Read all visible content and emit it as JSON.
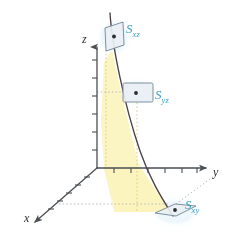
{
  "figure": {
    "title": "",
    "background": "#ffffff",
    "axes": {
      "z": {
        "label": "z",
        "x": 86,
        "y": 38,
        "color": "#4a4f54"
      },
      "y": {
        "label": "y",
        "x": 214,
        "y": 166,
        "color": "#4a4f54"
      },
      "x": {
        "label": "x",
        "x": 25,
        "y": 213,
        "color": "#4a4f54"
      }
    },
    "surfaces": [
      {
        "name": "S_xz",
        "label": "S",
        "subscript": "xz",
        "label_x": 126,
        "label_y": 23,
        "plane": "xz",
        "point_x": 115,
        "point_y": 37,
        "color": "#3b9dc4"
      },
      {
        "name": "S_yz",
        "label": "S",
        "subscript": "yz",
        "label_x": 152,
        "label_y": 88,
        "plane": "yz",
        "point_x": 135,
        "point_y": 92,
        "color": "#3b9dc4"
      },
      {
        "name": "S_xy",
        "label": "S",
        "subscript": "xy",
        "label_x": 184,
        "label_y": 198,
        "plane": "xy",
        "point_x": 173,
        "point_y": 211,
        "color": "#3b9dc4"
      }
    ],
    "curve": {
      "name": "space-curve",
      "color": "#4a4146",
      "description": "curve descending from upper-left through the yz box down to the xy plane"
    },
    "shaded_region": {
      "name": "projection-surface",
      "fill": "#fcf6c8",
      "description": "pale yellow ruled surface between curve and xy-plane"
    },
    "origin": {
      "x": 97,
      "y": 168
    },
    "colors": {
      "axis": "#4a4f54",
      "curve": "#4a4146",
      "label": "#3b9dc4",
      "shade": "#fbf4c0",
      "box_fill": "#e8eef3",
      "box_stroke": "#7f8f9b",
      "glow": "#dff1fb",
      "dotted_grey": "#b9babb",
      "dotted_yellow": "#e2cf7a"
    }
  }
}
